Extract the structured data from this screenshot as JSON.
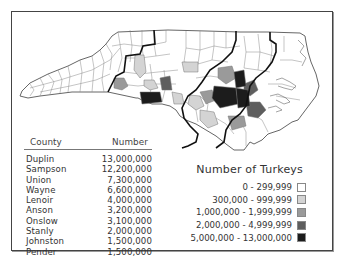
{
  "table": {
    "headers": {
      "county": "County",
      "number": "Number"
    },
    "rows": [
      {
        "county": "Duplin",
        "number": "13,000,000"
      },
      {
        "county": "Sampson",
        "number": "12,200,000"
      },
      {
        "county": "Union",
        "number": "7,300,000"
      },
      {
        "county": "Wayne",
        "number": "6,600,000"
      },
      {
        "county": "Lenoir",
        "number": "4,000,000"
      },
      {
        "county": "Anson",
        "number": "3,200,000"
      },
      {
        "county": "Onslow",
        "number": "3,100,000"
      },
      {
        "county": "Stanly",
        "number": "2,000,000"
      },
      {
        "county": "Johnston",
        "number": "1,500,000"
      },
      {
        "county": "Pender",
        "number": "1,500,000"
      }
    ]
  },
  "legend": {
    "title": "Number of Turkeys",
    "items": [
      {
        "label": "0 - 299,999",
        "color": "#ffffff"
      },
      {
        "label": "300,000 - 999,999",
        "color": "#d4d4d4"
      },
      {
        "label": "1,000,000 - 1,999,999",
        "color": "#9a9a9a"
      },
      {
        "label": "2,000,000 - 4,999,999",
        "color": "#5e5e5e"
      },
      {
        "label": "5,000,000 - 13,000,000",
        "color": "#1c1c1c"
      }
    ]
  },
  "map": {
    "region": "North Carolina counties",
    "fills": {
      "none": "#ffffff",
      "low": "#d4d4d4",
      "mid": "#9a9a9a",
      "high": "#5e5e5e",
      "top": "#1c1c1c"
    },
    "line_color": "#8a8a8a",
    "divider_color": "#111111"
  }
}
